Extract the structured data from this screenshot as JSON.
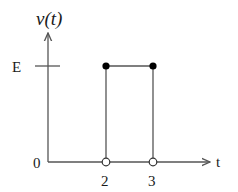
{
  "diagram": {
    "type": "rectangular-pulse-signal",
    "y_label": "v(t)",
    "x_label": "t",
    "origin_label": "0",
    "level_label": "E",
    "x_ticks": [
      "2",
      "3"
    ],
    "pulse": {
      "start": 2,
      "end": 3,
      "amplitude": "E"
    },
    "endpoints": {
      "top": "filled",
      "bottom": "open"
    },
    "colors": {
      "line": "#555555",
      "dot": "#000000",
      "text": "#1a1a1a"
    }
  }
}
